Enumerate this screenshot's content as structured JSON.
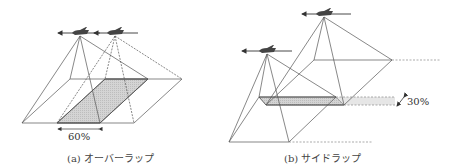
{
  "figure": {
    "panel_a": {
      "caption": "(a) オーバーラップ",
      "overlap_label": "60%",
      "overlap_type": "forward overlap",
      "aircraft_count": 2
    },
    "panel_b": {
      "caption": "(b) サイドラップ",
      "overlap_label": "30%",
      "overlap_type": "side overlap",
      "aircraft_count": 2
    },
    "colors": {
      "line": "#555555",
      "shade": "#cfcfcf",
      "dashed": "#888888",
      "aircraft": "#444444"
    }
  }
}
